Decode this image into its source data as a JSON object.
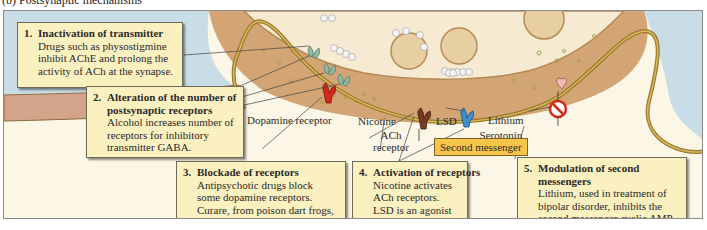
{
  "figure": {
    "heading": "(b) Postsynaptic mechanisms"
  },
  "callouts": [
    {
      "number": "1.",
      "title": "Inactivation of transmitter",
      "body": "Drugs such as physostigmine inhibit AChE and prolong the activity of ACh at the synapse."
    },
    {
      "number": "2.",
      "title": "Alteration of the number of postsynaptic receptors",
      "body": "Alcohol increases number of receptors for inhibitory transmitter GABA."
    },
    {
      "number": "3.",
      "title": "Blockade of receptors",
      "body": "Antipsychotic drugs block some dopamine receptors. Curare, from poison dart frogs, blocks nicotinic ACh receptors."
    },
    {
      "number": "4.",
      "title": "Activation of receptors",
      "body": "Nicotine activates ACh receptors. LSD is an agonist at some serotonin receptors."
    },
    {
      "number": "5.",
      "title": "Modulation of second messengers",
      "body": "Lithium, used in treatment of bipolar disorder, inhibits the second messenger cyclic AMP."
    }
  ],
  "labels": {
    "dopamine_receptor": "Dopamine receptor",
    "nicotine": "Nicotine",
    "ach_receptor": "ACh receptor",
    "lsd": "LSD",
    "serotonin_receptor": "Serotonin receptor",
    "lithium": "Lithium",
    "second_messenger": "Second messenger"
  },
  "colors": {
    "callout_bg": "#fbf0bf",
    "second_messenger_bg": "#f6c54a",
    "dopamine_receptor": "#d42a1e",
    "ach_receptor": "#7a3a22",
    "serotonin_receptor": "#3f8fcf",
    "gaba_receptor": "#8fb8a8",
    "extracellular": "#c9dde6",
    "presynaptic": "#d3a574",
    "membrane": "#9c7a2e"
  }
}
